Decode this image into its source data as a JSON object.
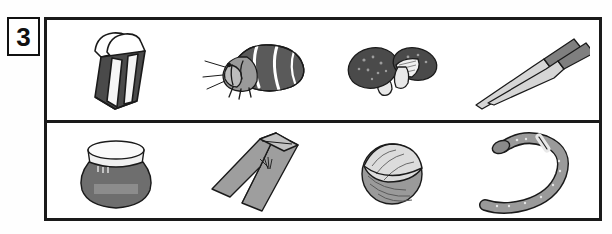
{
  "badge": {
    "number": "3"
  },
  "frame": {
    "rows": [
      {
        "name": "row-top",
        "items": [
          {
            "icon": "eraser-icon",
            "label": "eraser"
          },
          {
            "icon": "hermit-crab-icon",
            "label": "hermit crab"
          },
          {
            "icon": "shiitake-mushroom-icon",
            "label": "shiitake mushrooms"
          },
          {
            "icon": "chopsticks-icon",
            "label": "chopsticks"
          }
        ]
      },
      {
        "name": "row-bottom",
        "items": [
          {
            "icon": "jar-icon",
            "label": "jar",
            "jar_label_text": ""
          },
          {
            "icon": "trousers-icon",
            "label": "trousers"
          },
          {
            "icon": "walnut-icon",
            "label": "walnut"
          },
          {
            "icon": "snake-icon",
            "label": "snake"
          }
        ]
      }
    ]
  },
  "colors": {
    "outline": "#1a1a1a",
    "dark_gray": "#4a4a4a",
    "mid_gray": "#8a8a8a",
    "light_gray": "#c8c8c8",
    "pale_gray": "#e4e4e4",
    "white": "#ffffff"
  }
}
